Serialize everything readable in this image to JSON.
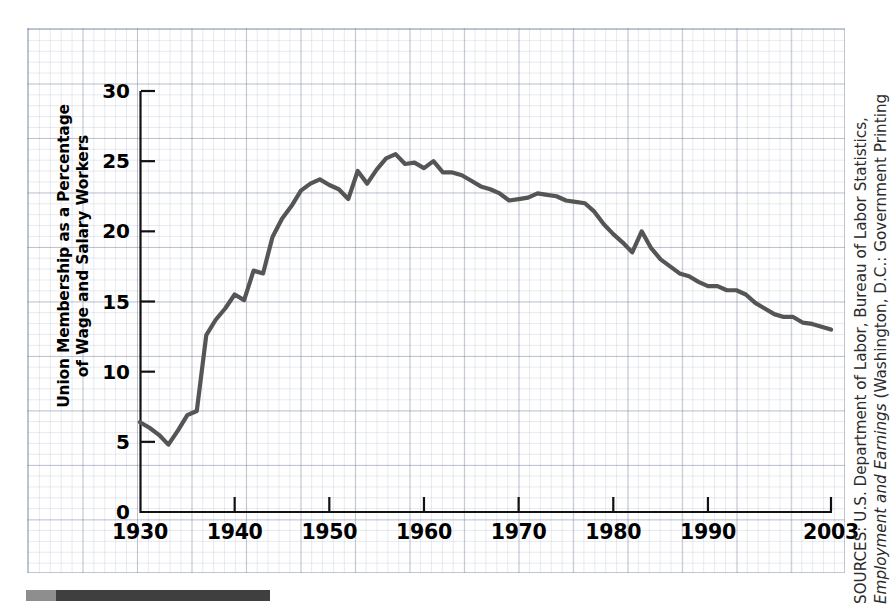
{
  "chart_data": {
    "type": "line",
    "title": "",
    "xlabel": "",
    "ylabel": "Union Membership as a Percentage of Wage and Salary Workers",
    "ylabel_lines": [
      "Union Membership as a Percentage",
      "of Wage and Salary Workers"
    ],
    "xlim": [
      1930,
      2003
    ],
    "ylim": [
      0,
      30
    ],
    "grid": true,
    "legend": "none",
    "line_color": "#555555",
    "y_ticks": [
      0,
      5,
      10,
      15,
      20,
      25,
      30
    ],
    "y_tick_labels": [
      "0",
      "5",
      "10",
      "15",
      "20",
      "25",
      "30"
    ],
    "x_ticks": [
      1930,
      1940,
      1950,
      1960,
      1970,
      1980,
      1990,
      2003
    ],
    "x_tick_labels": [
      "1930",
      "1940",
      "1950",
      "1960",
      "1970",
      "1980",
      "1990",
      "2003"
    ],
    "series": [
      {
        "name": "Union membership as a percentage of wage and salary workers",
        "x": [
          1930,
          1931,
          1932,
          1933,
          1934,
          1935,
          1936,
          1937,
          1938,
          1939,
          1940,
          1941,
          1942,
          1943,
          1944,
          1945,
          1946,
          1947,
          1948,
          1949,
          1950,
          1951,
          1952,
          1953,
          1954,
          1955,
          1956,
          1957,
          1958,
          1959,
          1960,
          1961,
          1962,
          1963,
          1964,
          1965,
          1966,
          1967,
          1968,
          1969,
          1970,
          1971,
          1972,
          1973,
          1974,
          1975,
          1976,
          1977,
          1978,
          1979,
          1980,
          1981,
          1982,
          1983,
          1984,
          1985,
          1986,
          1987,
          1988,
          1989,
          1990,
          1991,
          1992,
          1993,
          1994,
          1995,
          1996,
          1997,
          1998,
          1999,
          2000,
          2001,
          2002,
          2003
        ],
        "values": [
          6.4,
          6.0,
          5.5,
          4.8,
          5.8,
          6.9,
          7.2,
          12.6,
          13.7,
          14.5,
          15.5,
          15.1,
          17.2,
          17.0,
          19.6,
          20.9,
          21.8,
          22.9,
          23.4,
          23.7,
          23.3,
          23.0,
          22.3,
          24.3,
          23.4,
          24.4,
          25.2,
          25.5,
          24.8,
          24.9,
          24.5,
          25.0,
          24.2,
          24.2,
          24.0,
          23.6,
          23.2,
          23.0,
          22.7,
          22.2,
          22.3,
          22.4,
          22.7,
          22.6,
          22.5,
          22.2,
          22.1,
          22.0,
          21.4,
          20.5,
          19.8,
          19.2,
          18.5,
          20.0,
          18.8,
          18.0,
          17.5,
          17.0,
          16.8,
          16.4,
          16.1,
          16.1,
          15.8,
          15.8,
          15.5,
          14.9,
          14.5,
          14.1,
          13.9,
          13.9,
          13.5,
          13.4,
          13.2,
          13.0
        ]
      }
    ]
  },
  "source": {
    "lines": [
      "SOURCES: U.S. Department of Labor, Bureau of Labor Statistics,",
      "Employment and Earnings (Washington, D.C.: Government Printing"
    ],
    "line1": "SOURCES: U.S. Department of Labor, Bureau of Labor Statistics,",
    "line2_italic": "Employment and Earnings",
    "line2_rest": " (Washington, D.C.: Government Printing"
  }
}
